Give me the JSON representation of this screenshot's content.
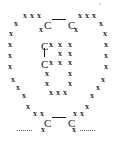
{
  "figure": {
    "type": "lewis-dot-cross-structure",
    "title": "",
    "canvas": {
      "width": 114,
      "height": 141
    },
    "background_color": "#ffffff",
    "mark_color": "#2b2b2b",
    "atom_color": "#1a1a1a",
    "bond_color": "#1a1a1a",
    "dotted_bond_color": "#555555"
  },
  "symbols": {
    "cross": "x",
    "carbon": "C"
  },
  "atoms": [
    {
      "id": "c-top-left",
      "label": "C",
      "x": 44,
      "y": 20
    },
    {
      "id": "c-top-right",
      "label": "C",
      "x": 68,
      "y": 20
    },
    {
      "id": "c-mid-upper",
      "label": "C",
      "x": 41,
      "y": 41
    },
    {
      "id": "c-mid-lower",
      "label": "C",
      "x": 41,
      "y": 59
    },
    {
      "id": "c-bottom-left",
      "label": "C",
      "x": 44,
      "y": 118
    },
    {
      "id": "c-bottom-right",
      "label": "C",
      "x": 68,
      "y": 118
    }
  ],
  "bonds": [
    {
      "id": "bond-top",
      "style": "solid",
      "orientation": "horizontal",
      "x": 52,
      "y": 19,
      "length": 14
    },
    {
      "id": "bond-middle",
      "style": "solid",
      "orientation": "vertical",
      "x": 44,
      "y": 48,
      "length": 9
    },
    {
      "id": "bond-bottom",
      "style": "solid",
      "orientation": "horizontal",
      "x": 52,
      "y": 117,
      "length": 14
    },
    {
      "id": "bond-left-dotted",
      "style": "dotted",
      "orientation": "horizontal",
      "x": 17,
      "y": 130,
      "length": 15
    },
    {
      "id": "bond-right-dotted",
      "style": "dotted",
      "orientation": "horizontal",
      "x": 80,
      "y": 130,
      "length": 15
    }
  ],
  "crosses": [
    {
      "group": "outer-top-left-arc",
      "x": 23,
      "y": 12
    },
    {
      "group": "outer-top-left-arc",
      "x": 30,
      "y": 12
    },
    {
      "group": "outer-top-left-arc",
      "x": 37,
      "y": 12
    },
    {
      "group": "outer-top-left-arc",
      "x": 14,
      "y": 20
    },
    {
      "group": "outer-left-column",
      "x": 9,
      "y": 30
    },
    {
      "group": "outer-left-column",
      "x": 8,
      "y": 41
    },
    {
      "group": "outer-left-column",
      "x": 8,
      "y": 52
    },
    {
      "group": "outer-left-column",
      "x": 8,
      "y": 63
    },
    {
      "group": "outer-left-column",
      "x": 11,
      "y": 76
    },
    {
      "group": "outer-left-arc-lower",
      "x": 16,
      "y": 84
    },
    {
      "group": "outer-left-arc-lower",
      "x": 22,
      "y": 92
    },
    {
      "group": "outer-left-arc-lower",
      "x": 26,
      "y": 103
    },
    {
      "group": "outer-left-arc-lower",
      "x": 33,
      "y": 110
    },
    {
      "group": "outer-left-arc-lower",
      "x": 40,
      "y": 110
    },
    {
      "group": "outer-bottom-left-tip",
      "x": 41,
      "y": 126
    },
    {
      "group": "outer-top-right-arc",
      "x": 78,
      "y": 12
    },
    {
      "group": "outer-top-right-arc",
      "x": 85,
      "y": 12
    },
    {
      "group": "outer-top-right-arc",
      "x": 92,
      "y": 12
    },
    {
      "group": "outer-top-right-arc",
      "x": 99,
      "y": 20
    },
    {
      "group": "outer-right-column",
      "x": 103,
      "y": 30
    },
    {
      "group": "outer-right-column",
      "x": 104,
      "y": 41
    },
    {
      "group": "outer-right-column",
      "x": 104,
      "y": 52
    },
    {
      "group": "outer-right-column",
      "x": 104,
      "y": 63
    },
    {
      "group": "outer-right-column",
      "x": 101,
      "y": 76
    },
    {
      "group": "outer-right-arc-lower",
      "x": 96,
      "y": 84
    },
    {
      "group": "outer-right-arc-lower",
      "x": 90,
      "y": 92
    },
    {
      "group": "outer-right-arc-lower",
      "x": 85,
      "y": 103
    },
    {
      "group": "outer-right-arc-lower",
      "x": 73,
      "y": 110
    },
    {
      "group": "outer-right-arc-lower",
      "x": 80,
      "y": 110
    },
    {
      "group": "outer-bottom-right-tip",
      "x": 72,
      "y": 126
    },
    {
      "group": "inner-top-left",
      "x": 39,
      "y": 26
    },
    {
      "group": "inner-top-right",
      "x": 74,
      "y": 26
    },
    {
      "group": "inner-upper-row",
      "x": 49,
      "y": 41
    },
    {
      "group": "inner-upper-row",
      "x": 58,
      "y": 41
    },
    {
      "group": "inner-upper-row",
      "x": 68,
      "y": 41
    },
    {
      "group": "inner-mid-row",
      "x": 58,
      "y": 50
    },
    {
      "group": "inner-mid-row",
      "x": 68,
      "y": 50
    },
    {
      "group": "inner-lower-row",
      "x": 49,
      "y": 59
    },
    {
      "group": "inner-lower-row",
      "x": 58,
      "y": 59
    },
    {
      "group": "inner-lower-row",
      "x": 68,
      "y": 59
    },
    {
      "group": "inner-column-left",
      "x": 45,
      "y": 70
    },
    {
      "group": "inner-column-left",
      "x": 45,
      "y": 80
    },
    {
      "group": "inner-column-right",
      "x": 68,
      "y": 70
    },
    {
      "group": "inner-column-right",
      "x": 68,
      "y": 80
    },
    {
      "group": "inner-bottom-arc",
      "x": 49,
      "y": 89
    },
    {
      "group": "inner-bottom-arc",
      "x": 56,
      "y": 89
    },
    {
      "group": "inner-bottom-arc",
      "x": 63,
      "y": 89
    }
  ],
  "specks": [
    {
      "x": 99,
      "y": 3
    },
    {
      "x": 100,
      "y": 4
    }
  ]
}
